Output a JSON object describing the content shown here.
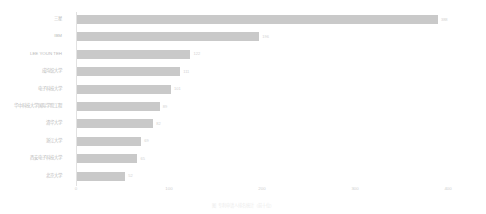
{
  "chart_data": {
    "type": "bar",
    "orientation": "horizontal",
    "title": "",
    "xlabel": "",
    "ylabel": "",
    "xlim": [
      0,
      430
    ],
    "xticks": [
      0,
      100,
      200,
      300,
      400
    ],
    "xtick_labels": [
      "0",
      "100",
      "200",
      "300",
      "400"
    ],
    "grid": false,
    "legend": false,
    "bar_color": "#c9c9c9",
    "categories": [
      "三星",
      "IBM",
      "LEE YOUN TEH",
      "成均馆大学",
      "电子科技大学",
      "华中科技大学国际学院工程",
      "清华大学",
      "浙江大学",
      "西安电子科技大学",
      "北京大学"
    ],
    "values": [
      388,
      196,
      122,
      111,
      101,
      89,
      82,
      69,
      65,
      52
    ],
    "value_labels": [
      "388",
      "196",
      "122",
      "111",
      "101",
      "89",
      "82",
      "69",
      "65",
      "52"
    ]
  },
  "caption": {
    "text": "图 专利申请人排名统计（前十位）"
  }
}
